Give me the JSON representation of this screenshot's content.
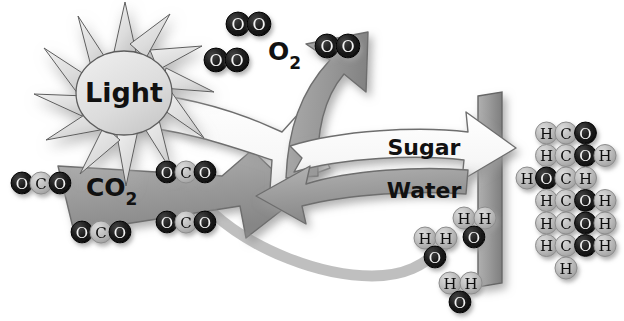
{
  "diagram": {
    "background_color": "#ffffff",
    "labels": {
      "light": "Light",
      "oxygen": "O",
      "oxygen_sub": "2",
      "carbon_dioxide": "CO",
      "carbon_dioxide_sub": "2",
      "sugar": "Sugar",
      "water": "Water"
    },
    "colors": {
      "arrow_gray": "#9a9a9a",
      "arrow_gray_dark": "#8a8a8a",
      "arrow_white": "#fbfbfb",
      "sun_fill": "#dcdcdc",
      "stem_fill": "#9d9d9d",
      "atom_dark": "#1c1c1c",
      "atom_light": "#b8b8b8",
      "outline": "#5a5a5a",
      "shadow": "#b9b9b9"
    },
    "oxygen_molecules": [
      {
        "id": "o2-a",
        "x": 216,
        "y": 60,
        "atoms": [
          "O",
          "O"
        ]
      },
      {
        "id": "o2-b",
        "x": 238,
        "y": 24,
        "atoms": [
          "O",
          "O"
        ]
      },
      {
        "id": "o2-c",
        "x": 327,
        "y": 46,
        "atoms": [
          "O",
          "O"
        ]
      }
    ],
    "carbon_dioxide_molecules": [
      {
        "id": "co2-a",
        "x": 22,
        "y": 183,
        "atoms": [
          "O",
          "C",
          "O"
        ]
      },
      {
        "id": "co2-b",
        "x": 167,
        "y": 172,
        "atoms": [
          "O",
          "C",
          "O"
        ]
      },
      {
        "id": "co2-c",
        "x": 82,
        "y": 232,
        "atoms": [
          "O",
          "C",
          "O"
        ]
      },
      {
        "id": "co2-d",
        "x": 167,
        "y": 222,
        "atoms": [
          "O",
          "C",
          "O"
        ]
      }
    ],
    "water_molecules": [
      {
        "id": "h2o-a",
        "x": 425,
        "y": 238,
        "atoms": [
          "H",
          "H",
          "O"
        ]
      },
      {
        "id": "h2o-b",
        "x": 464,
        "y": 218,
        "atoms": [
          "H",
          "H",
          "O"
        ]
      },
      {
        "id": "h2o-c",
        "x": 450,
        "y": 283,
        "atoms": [
          "H",
          "H",
          "O"
        ]
      }
    ],
    "sugar_molecule": {
      "name": "glucose-structural-formula",
      "rows": [
        {
          "id": "row-1",
          "cells": [
            null,
            "H",
            "C",
            "O",
            null
          ]
        },
        {
          "id": "row-2",
          "cells": [
            null,
            "H",
            "C",
            "O",
            "H"
          ]
        },
        {
          "id": "row-3",
          "cells": [
            "H",
            "O",
            "C",
            "H",
            null
          ]
        },
        {
          "id": "row-4",
          "cells": [
            null,
            "H",
            "C",
            "O",
            "H"
          ]
        },
        {
          "id": "row-5",
          "cells": [
            null,
            "H",
            "C",
            "O",
            "H"
          ]
        },
        {
          "id": "row-6",
          "cells": [
            null,
            "H",
            "C",
            "O",
            "H"
          ]
        },
        {
          "id": "row-7",
          "cells": [
            null,
            null,
            "H",
            null,
            null
          ]
        }
      ]
    }
  }
}
